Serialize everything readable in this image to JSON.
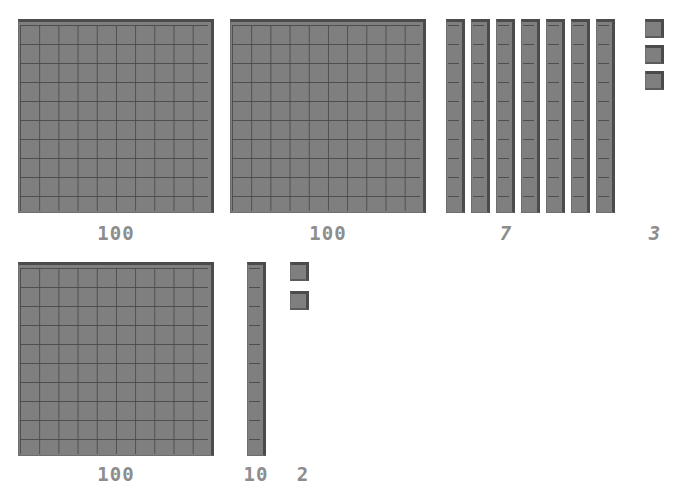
{
  "document": {
    "kind": "base-ten-blocks-diagram",
    "background_color": "#ffffff",
    "block_fill_color": "#7f7f7f",
    "block_grid_line_color": "#464646",
    "block_edge_color": "#4b4b4b",
    "label_color": "#8d8d8d"
  },
  "rows": [
    {
      "name": "top-row",
      "groups": [
        {
          "name": "hundreds-flat-1",
          "piece_type": "flat",
          "value": 100,
          "label": "100",
          "label_style": "upright",
          "columns": 10,
          "rows": 10,
          "count": 1
        },
        {
          "name": "hundreds-flat-2",
          "piece_type": "flat",
          "value": 100,
          "label": "100",
          "label_style": "upright",
          "columns": 10,
          "rows": 10,
          "count": 1
        },
        {
          "name": "tens-rods-group",
          "piece_type": "rod",
          "value": 10,
          "label": "7",
          "label_style": "italic",
          "columns": 1,
          "rows": 10,
          "count": 7
        },
        {
          "name": "ones-cubes-group",
          "piece_type": "cube",
          "value": 1,
          "label": "3",
          "label_style": "italic",
          "columns": 1,
          "rows": 1,
          "count": 3
        }
      ]
    },
    {
      "name": "bottom-row",
      "groups": [
        {
          "name": "hundreds-flat-3",
          "piece_type": "flat",
          "value": 100,
          "label": "100",
          "label_style": "upright",
          "columns": 10,
          "rows": 10,
          "count": 1
        },
        {
          "name": "tens-rod-single",
          "piece_type": "rod",
          "value": 10,
          "label": "10",
          "label_style": "upright",
          "columns": 1,
          "rows": 10,
          "count": 1
        },
        {
          "name": "ones-cubes-pair",
          "piece_type": "cube",
          "value": 1,
          "label": "2",
          "label_style": "upright",
          "columns": 1,
          "rows": 1,
          "count": 2
        }
      ]
    }
  ],
  "labels": {
    "top_flat_1": "100",
    "top_flat_2": "100",
    "top_rods": "7",
    "top_cubes": "3",
    "bottom_flat": "100",
    "bottom_rod": "10",
    "bottom_cubes": "2"
  }
}
